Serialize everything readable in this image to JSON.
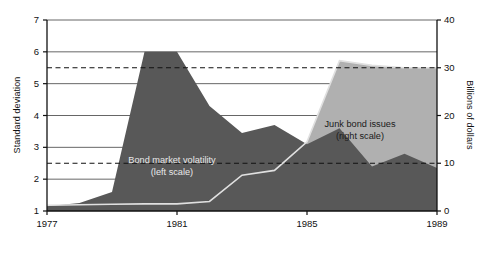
{
  "chart_data": {
    "type": "area",
    "title": "",
    "subtitle": "",
    "xlabel": "",
    "ylabel": "Standard deviation",
    "ylabel_right": "Billions of dollars",
    "xlim": [
      1977,
      1989
    ],
    "ylim": [
      1,
      7
    ],
    "ylim_right": [
      0,
      40
    ],
    "grid": true,
    "legend_position": "inline-annotations",
    "x_ticks": [
      "1977",
      "1981",
      "1985",
      "1989"
    ],
    "x_tick_values": [
      1977,
      1981,
      1985,
      1989
    ],
    "y_ticks_left": [
      "1",
      "2",
      "3",
      "4",
      "5",
      "6",
      "7"
    ],
    "y_tick_values_left": [
      1,
      2,
      3,
      4,
      5,
      6,
      7
    ],
    "y_ticks_right": [
      "0",
      "10",
      "20",
      "30",
      "40"
    ],
    "y_tick_values_right": [
      0,
      10,
      20,
      30,
      40
    ],
    "reference_lines": [
      {
        "name": "upper-dashed-reference",
        "axis": "left",
        "value": 5.5,
        "style": "dashed"
      },
      {
        "name": "lower-dashed-reference",
        "axis": "left",
        "value": 2.5,
        "style": "dashed"
      }
    ],
    "x": [
      1977,
      1978,
      1979,
      1980,
      1981,
      1982,
      1983,
      1984,
      1985,
      1986,
      1987,
      1988,
      1989
    ],
    "series": [
      {
        "name": "Bond market volatility",
        "axis": "left",
        "color": "#585858",
        "label": "Bond market volatility",
        "label_scale": "(left scale)",
        "values": [
          1.15,
          1.25,
          1.6,
          6.0,
          6.0,
          4.3,
          3.45,
          3.7,
          3.1,
          3.6,
          2.4,
          2.8,
          2.35
        ]
      },
      {
        "name": "Junk bond issues",
        "axis": "right",
        "color": "#b0b0b0",
        "label": "Junk bond issues",
        "label_scale": "(right scale)",
        "values": [
          1.2,
          1.3,
          1.4,
          1.5,
          1.5,
          2.0,
          7.5,
          8.5,
          14.5,
          31.5,
          30.5,
          30.0,
          30.0
        ]
      }
    ],
    "colors": {
      "volatility_fill": "#585858",
      "junk_fill": "#b0b0b0",
      "junk_line": "#e0e0e0",
      "axis": "#111111",
      "grid": "#555555",
      "background": "#ffffff"
    }
  }
}
